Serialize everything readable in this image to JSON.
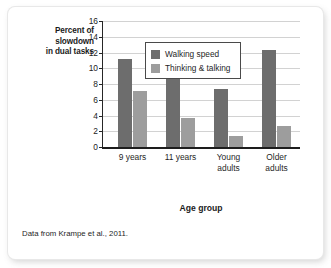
{
  "figure": {
    "caption": "Data from Krampe et al., 2011."
  },
  "chart_data": {
    "type": "bar",
    "title": "",
    "xlabel": "Age group",
    "ylabel": "Percent of\nslowdown\nin dual tasks",
    "ylabel_lines": [
      "Percent of",
      "slowdown",
      "in dual tasks"
    ],
    "categories": [
      "9 years",
      "11 years",
      "Young adults",
      "Older adults"
    ],
    "category_lines": [
      [
        "9 years"
      ],
      [
        "11 years"
      ],
      [
        "Young",
        "adults"
      ],
      [
        "Older",
        "adults"
      ]
    ],
    "series": [
      {
        "name": "Walking speed",
        "color": "#6d6d6d",
        "values": [
          11.2,
          9.2,
          7.4,
          12.3
        ]
      },
      {
        "name": "Thinking & talking",
        "color": "#9d9d9d",
        "values": [
          7.1,
          3.7,
          1.35,
          2.7
        ]
      }
    ],
    "ylim": [
      0,
      16
    ],
    "yticks": [
      0,
      2,
      4,
      6,
      8,
      10,
      12,
      14,
      16
    ],
    "ytick_labels": [
      "0",
      "2",
      "4",
      "6",
      "8",
      "10",
      "12",
      "14",
      "16"
    ],
    "grid": true,
    "grid_axis": "y",
    "legend_position": "upper center",
    "legend_entries": [
      "Walking speed",
      "Thinking & talking"
    ]
  }
}
